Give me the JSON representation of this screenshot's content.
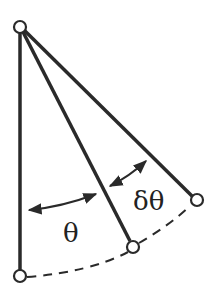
{
  "diagram": {
    "labels": {
      "theta": "θ",
      "delta_theta": "δθ"
    },
    "colors": {
      "line": "#2a2a2a",
      "background": "#ffffff"
    },
    "points": {
      "pivot": [
        20,
        27
      ],
      "rest_bob": [
        20,
        276
      ],
      "bob_theta": [
        133,
        247
      ],
      "bob_theta_plus_delta": [
        197,
        200
      ]
    }
  }
}
